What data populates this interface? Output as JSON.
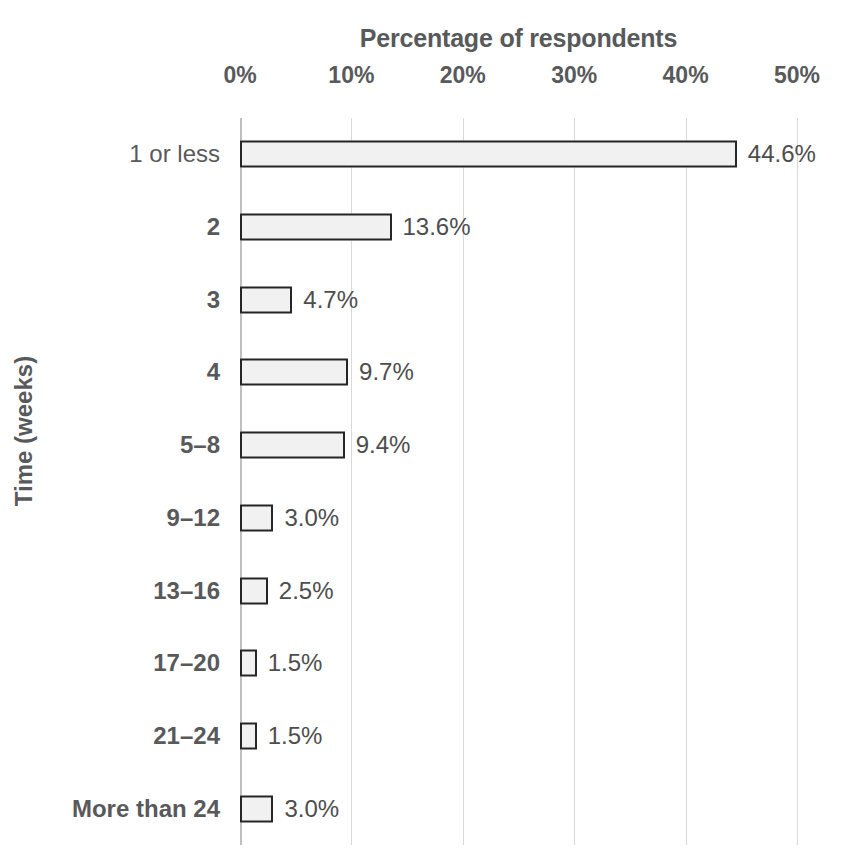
{
  "chart_data": {
    "type": "bar",
    "orientation": "horizontal",
    "title": "Percentage of respondents",
    "xlabel": "Percentage of respondents",
    "ylabel": "Time (weeks)",
    "xlim": [
      0,
      50
    ],
    "xtick_labels": [
      "0%",
      "10%",
      "20%",
      "30%",
      "40%",
      "50%"
    ],
    "xticks": [
      0,
      10,
      20,
      30,
      40,
      50
    ],
    "grid": "vertical",
    "legend": "none",
    "axis_position": "x-axis-on-top",
    "categories": [
      "1 or less",
      "2",
      "3",
      "4",
      "5–8",
      "9–12",
      "13–16",
      "17–20",
      "21–24",
      "More than 24"
    ],
    "values": [
      44.6,
      13.6,
      4.7,
      9.7,
      9.4,
      3.0,
      2.5,
      1.5,
      1.5,
      3.0
    ],
    "data_labels": [
      "44.6%",
      "13.6%",
      "4.7%",
      "9.7%",
      "9.4%",
      "3.0%",
      "2.5%",
      "1.5%",
      "1.5%",
      "3.0%"
    ],
    "category_label_bold": [
      false,
      true,
      true,
      true,
      true,
      true,
      true,
      true,
      true,
      true
    ],
    "colors": {
      "bar_fill": "#f1f1f1",
      "bar_border": "#262626",
      "text": "#58595b",
      "data_label_text": "#4d4d4d",
      "gridline": "#d9d9d9",
      "background": "#ffffff"
    }
  }
}
